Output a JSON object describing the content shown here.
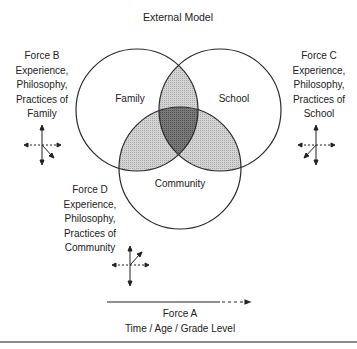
{
  "title": "External Model",
  "circles": {
    "family": "Family",
    "school": "School",
    "community": "Community"
  },
  "forces": {
    "b": {
      "title": "Force B",
      "lines": [
        "Experience,",
        "Philosophy,",
        "Practices of",
        "Family"
      ]
    },
    "c": {
      "title": "Force C",
      "lines": [
        "Experience,",
        "Philosophy,",
        "Practices of",
        "School"
      ]
    },
    "d": {
      "title": "Force D",
      "lines": [
        "Experience,",
        "Philosophy,",
        "Practices of",
        "Community"
      ]
    },
    "a": {
      "title": "Force A",
      "subtitle": "Time / Age / Grade Level"
    }
  },
  "colors": {
    "outline": "#2a2a2a",
    "pair_overlap": "#c8c8c8",
    "triple_overlap": "#6e6e6e"
  }
}
